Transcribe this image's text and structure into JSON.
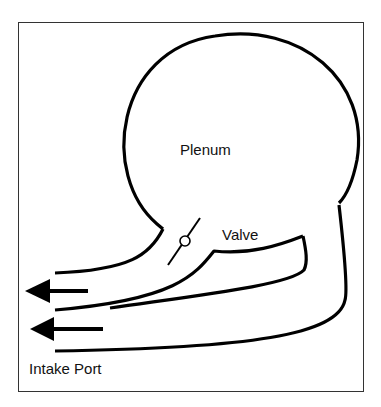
{
  "diagram": {
    "type": "intake-plenum-schematic",
    "labels": {
      "plenum": "Plenum",
      "valve": "Valve",
      "intake_port": "Intake Port"
    },
    "arrows": [
      {
        "direction": "left",
        "description": "upper flow arrow"
      },
      {
        "direction": "left",
        "description": "lower flow arrow"
      }
    ],
    "colors": {
      "line": "#000000",
      "frame": "#333333",
      "background": "#ffffff"
    }
  }
}
